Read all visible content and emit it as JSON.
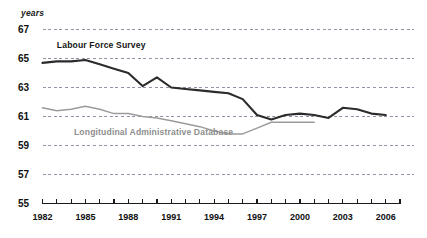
{
  "chart_data": {
    "type": "line",
    "title": "",
    "subtitle": "",
    "xlabel": "",
    "ylabel": "years",
    "ylim": [
      55,
      67
    ],
    "xlim": [
      1982,
      2007
    ],
    "grid": true,
    "grid_style": "dashed-horizontal",
    "legend_position": "inline-annotations",
    "y_ticks": [
      67,
      65,
      63,
      61,
      59,
      57,
      55
    ],
    "y_tick_labels": [
      "67",
      "65",
      "63",
      "61",
      "59",
      "57",
      "55"
    ],
    "x_ticks": [
      1982,
      1983,
      1984,
      1985,
      1986,
      1987,
      1988,
      1989,
      1990,
      1991,
      1992,
      1993,
      1994,
      1995,
      1996,
      1997,
      1998,
      1999,
      2000,
      2001,
      2002,
      2003,
      2004,
      2005,
      2006
    ],
    "x_tick_labels_shown": [
      "1982",
      "1985",
      "1988",
      "1991",
      "1994",
      "1997",
      "2000",
      "2003",
      "2006"
    ],
    "series": [
      {
        "name": "Labour Force Survey",
        "color": "#2b2b2b",
        "label_x": 1983.0,
        "label_y": 65.9,
        "x": [
          1982,
          1983,
          1984,
          1985,
          1986,
          1987,
          1988,
          1989,
          1990,
          1991,
          1992,
          1993,
          1994,
          1995,
          1996,
          1997,
          1998,
          1999,
          2000,
          2001,
          2002,
          2003,
          2004,
          2005,
          2006
        ],
        "values": [
          64.7,
          64.8,
          64.8,
          64.9,
          64.6,
          64.3,
          64.0,
          63.1,
          63.7,
          63.0,
          62.9,
          62.8,
          62.7,
          62.6,
          62.2,
          61.1,
          60.8,
          61.1,
          61.2,
          61.1,
          60.9,
          61.6,
          61.5,
          61.2,
          61.1
        ]
      },
      {
        "name": "Longitudinal Administrative Database",
        "color": "#9b9b9b",
        "label_x": 1984.2,
        "label_y": 59.9,
        "x": [
          1982,
          1983,
          1984,
          1985,
          1986,
          1987,
          1988,
          1989,
          1990,
          1991,
          1992,
          1993,
          1994,
          1995,
          1996,
          1997,
          1998,
          1999,
          2000,
          2001
        ],
        "values": [
          61.6,
          61.4,
          61.5,
          61.7,
          61.5,
          61.2,
          61.2,
          61.0,
          60.9,
          60.7,
          60.5,
          60.3,
          60.0,
          59.8,
          59.8,
          60.2,
          60.6,
          60.6,
          60.6,
          60.6
        ]
      }
    ]
  },
  "axis": {
    "unit_label": "years"
  }
}
